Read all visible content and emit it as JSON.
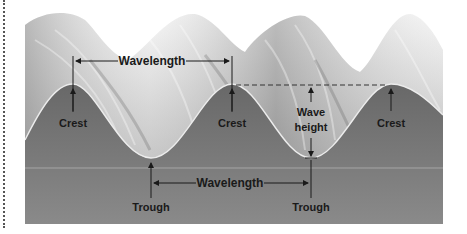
{
  "figure": {
    "labels": {
      "wavelength_top": "Wavelength",
      "wavelength_bottom": "Wavelength",
      "crest_1": "Crest",
      "crest_2": "Crest",
      "crest_3": "Crest",
      "wave_height_line1": "Wave",
      "wave_height_line2": "height",
      "trough_1": "Trough",
      "trough_2": "Trough"
    },
    "colors": {
      "water_body": "#6e6e6e",
      "water_lower": "#808080",
      "surface_line": "#e8e8e8",
      "foam_light": "#f2f2f2",
      "foam_mid": "#b8b8b8",
      "arrow": "#1a1a1a",
      "label_text": "#1a1a1a",
      "page_background": "#ffffff"
    }
  }
}
